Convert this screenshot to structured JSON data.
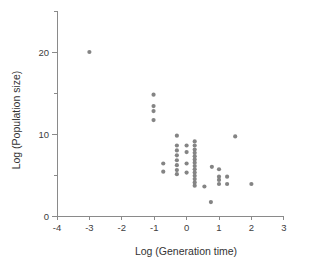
{
  "chart_data": {
    "type": "scatter",
    "title": "",
    "xlabel": "Log (Generation time)",
    "ylabel": "Log (Population size)",
    "xlim": [
      -4,
      3
    ],
    "ylim": [
      0,
      25
    ],
    "xticks": [
      -4,
      -3,
      -2,
      -1,
      0,
      1,
      2,
      3
    ],
    "xticklabels": [
      "-4",
      "-3",
      "-2",
      "-1",
      "0",
      "1",
      "2",
      "3"
    ],
    "yticks": [
      0,
      5,
      10,
      15,
      20,
      25
    ],
    "yticklabels": [
      "0",
      "",
      "10",
      "",
      "20",
      ""
    ],
    "ylabeled_ticks": [
      0,
      10,
      20
    ],
    "grid": false,
    "legend": null,
    "marker_color": "#848484",
    "marker_size": 3,
    "points": [
      {
        "x": -3.0,
        "y": 20.0
      },
      {
        "x": -1.02,
        "y": 14.8
      },
      {
        "x": -1.02,
        "y": 13.4
      },
      {
        "x": -1.02,
        "y": 12.8
      },
      {
        "x": -1.02,
        "y": 11.7
      },
      {
        "x": -0.72,
        "y": 6.4
      },
      {
        "x": -0.72,
        "y": 5.4
      },
      {
        "x": -0.3,
        "y": 9.8
      },
      {
        "x": -0.3,
        "y": 8.6
      },
      {
        "x": -0.3,
        "y": 8.0
      },
      {
        "x": -0.3,
        "y": 7.4
      },
      {
        "x": -0.3,
        "y": 6.8
      },
      {
        "x": -0.3,
        "y": 6.2
      },
      {
        "x": -0.3,
        "y": 5.6
      },
      {
        "x": -0.3,
        "y": 5.1
      },
      {
        "x": 0.0,
        "y": 8.6
      },
      {
        "x": 0.0,
        "y": 7.8
      },
      {
        "x": 0.0,
        "y": 6.4
      },
      {
        "x": 0.0,
        "y": 5.3
      },
      {
        "x": 0.25,
        "y": 9.1
      },
      {
        "x": 0.25,
        "y": 8.6
      },
      {
        "x": 0.25,
        "y": 8.1
      },
      {
        "x": 0.25,
        "y": 7.7
      },
      {
        "x": 0.25,
        "y": 7.3
      },
      {
        "x": 0.25,
        "y": 6.9
      },
      {
        "x": 0.25,
        "y": 6.5
      },
      {
        "x": 0.25,
        "y": 6.1
      },
      {
        "x": 0.25,
        "y": 5.7
      },
      {
        "x": 0.25,
        "y": 5.3
      },
      {
        "x": 0.25,
        "y": 4.9
      },
      {
        "x": 0.25,
        "y": 4.5
      },
      {
        "x": 0.25,
        "y": 4.1
      },
      {
        "x": 0.25,
        "y": 3.7
      },
      {
        "x": 0.55,
        "y": 3.6
      },
      {
        "x": 0.75,
        "y": 1.7
      },
      {
        "x": 0.78,
        "y": 6.0
      },
      {
        "x": 1.0,
        "y": 5.7
      },
      {
        "x": 1.0,
        "y": 4.8
      },
      {
        "x": 1.0,
        "y": 4.4
      },
      {
        "x": 1.0,
        "y": 3.9
      },
      {
        "x": 1.25,
        "y": 4.8
      },
      {
        "x": 1.25,
        "y": 3.9
      },
      {
        "x": 1.5,
        "y": 9.7
      },
      {
        "x": 2.0,
        "y": 3.9
      }
    ]
  }
}
